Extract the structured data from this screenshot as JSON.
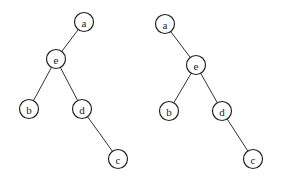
{
  "diagram": {
    "type": "binary-trees",
    "node_radius": 9.5,
    "colors": {
      "stroke": "#222222",
      "fill": "#ffffff",
      "background": "#ffffff"
    },
    "trees": [
      {
        "id": "left-tree",
        "nodes": [
          {
            "id": "a",
            "label": "a",
            "x": 84,
            "y": 22
          },
          {
            "id": "e",
            "label": "e",
            "x": 56,
            "y": 59
          },
          {
            "id": "b",
            "label": "b",
            "x": 29,
            "y": 109
          },
          {
            "id": "d",
            "label": "d",
            "x": 82,
            "y": 109
          },
          {
            "id": "c",
            "label": "c",
            "x": 118,
            "y": 159
          }
        ],
        "edges": [
          [
            "a",
            "e"
          ],
          [
            "e",
            "b"
          ],
          [
            "e",
            "d"
          ],
          [
            "d",
            "c"
          ]
        ]
      },
      {
        "id": "right-tree",
        "nodes": [
          {
            "id": "a",
            "label": "a",
            "x": 165,
            "y": 24
          },
          {
            "id": "e",
            "label": "e",
            "x": 196,
            "y": 65
          },
          {
            "id": "b",
            "label": "b",
            "x": 169,
            "y": 111
          },
          {
            "id": "d",
            "label": "d",
            "x": 222,
            "y": 111
          },
          {
            "id": "c",
            "label": "c",
            "x": 253,
            "y": 159
          }
        ],
        "edges": [
          [
            "a",
            "e"
          ],
          [
            "e",
            "b"
          ],
          [
            "e",
            "d"
          ],
          [
            "d",
            "c"
          ]
        ]
      }
    ]
  }
}
